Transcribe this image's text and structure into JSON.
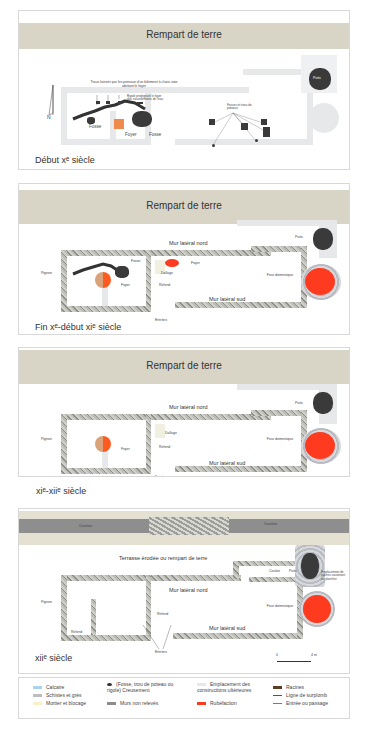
{
  "panels": [
    {
      "rampart_label": "Rempart de terre",
      "caption": "Début xᵉ siècle",
      "annotations": {
        "post_holes": "Trous laissés par les poteaux d'un bâtiment à claire-voie abritant le foyer",
        "ditch_note": "Rigole protégeant le foyer des ruissellements de l'eau",
        "fosse_left": "Fosse",
        "fosse_right": "Fosse",
        "foyer": "Foyer",
        "puits": "Puits",
        "fosses_center": "Fosses et trous de poteaux",
        "north": "N"
      }
    },
    {
      "rampart_label": "Rempart de terre",
      "caption": "Fin xᵉ-début xiᵉ siècle",
      "annotations": {
        "mur_nord": "Mur latéral nord",
        "mur_sud": "Mur latéral sud",
        "pignon": "Pignon",
        "fosse": "Fosse",
        "foyer_left": "Foyer",
        "foyer_right": "Foyer",
        "dallage": "Dallage",
        "refend": "Refend",
        "puits": "Puits",
        "four": "Four domestique",
        "entrees": "Entrées"
      }
    },
    {
      "rampart_label": "Rempart de terre",
      "caption": "xiᵉ-xiiᵉ siècle",
      "annotations": {
        "mur_nord": "Mur latéral nord",
        "mur_sud": "Mur latéral sud",
        "pignon": "Pignon",
        "foyer": "Foyer",
        "dallage": "Dallage",
        "refend": "Refend",
        "puits": "Puits",
        "four": "Four domestique",
        "entrees": "Entrées"
      }
    },
    {
      "courtine_left": "Courtine",
      "courtine_right": "Courtine",
      "caption": "xiiᵉ siècle",
      "annotations": {
        "terrasse": "Terrasse érodée ou rempart de terre",
        "mur_nord": "Mur latéral nord",
        "mur_sud": "Mur latéral sud",
        "pignon": "Pignon",
        "refend_left": "Refend",
        "refend_right": "Refend",
        "couloir": "Couloir",
        "puits": "Puits",
        "poutres": "Emplacement de poutres soutenant un plancher",
        "four": "Four domestique",
        "entrees": "Entrées",
        "scale_start": "0",
        "scale_end": "4 m"
      }
    }
  ],
  "legend": {
    "items": [
      {
        "label": "Calcaire",
        "color": "#a9d4ee"
      },
      {
        "label": "Schistes et grès",
        "color": "#bdbdbd"
      },
      {
        "label": "Mortier et blocage",
        "color": "#f6f2c8"
      },
      {
        "label": "(Fosse, trou de poteau ou rigole) Creusement",
        "color": "#2e2e2e"
      },
      {
        "label": "Murs non relevés",
        "color": "#8c8c8c"
      },
      {
        "label": "Emplacement des constructions ultérieures",
        "color": "#e6e8ea"
      },
      {
        "label": "Rubéfaction",
        "color": "#ff3b1f"
      },
      {
        "label": "Racines",
        "color": "#5a3f22"
      },
      {
        "label": "Ligne de surplomb",
        "color": "#555555"
      },
      {
        "label": "Entrée ou passage",
        "color": "#c8584a"
      }
    ]
  }
}
